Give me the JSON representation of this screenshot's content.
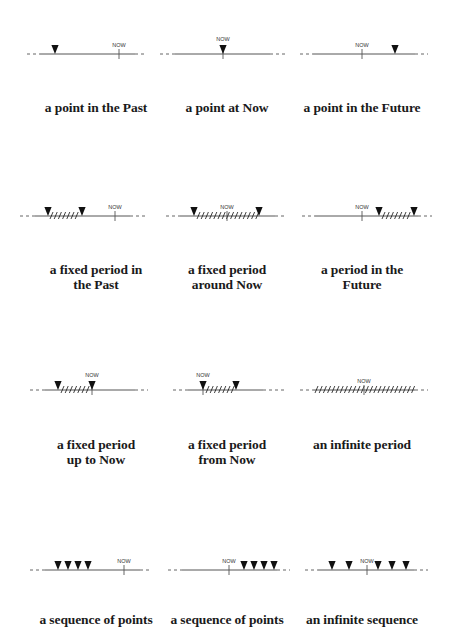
{
  "now_label": "NOW",
  "colors": {
    "line": "#555555",
    "marker": "#111111",
    "text": "#1a1a1a"
  },
  "cells": [
    {
      "id": "point-past",
      "col": 0,
      "row": 0,
      "line_y": 54,
      "solid": [
        40,
        135
      ],
      "dash_left": [
        27,
        40
      ],
      "dash_right": [
        135,
        147
      ],
      "now_x": 119,
      "now_label_above_marker": false,
      "markers": [
        55
      ],
      "hatch": null,
      "label": [
        "a point in the Past"
      ],
      "label_y": 112
    },
    {
      "id": "point-now",
      "col": 1,
      "row": 0,
      "line_y": 54,
      "solid": [
        175,
        270
      ],
      "dash_left": [
        160,
        175
      ],
      "dash_right": [
        270,
        285
      ],
      "now_x": 223,
      "now_label_above_marker": true,
      "markers": [
        223
      ],
      "hatch": null,
      "label": [
        "a point at Now"
      ],
      "label_y": 112
    },
    {
      "id": "point-future",
      "col": 2,
      "row": 0,
      "line_y": 54,
      "solid": [
        313,
        415
      ],
      "dash_left": [
        300,
        313
      ],
      "dash_right": [
        415,
        428
      ],
      "now_x": 362,
      "now_label_above_marker": false,
      "markers": [
        395
      ],
      "hatch": null,
      "label": [
        "a point in the Future"
      ],
      "label_y": 112
    },
    {
      "id": "period-past",
      "col": 0,
      "row": 1,
      "line_y": 216,
      "solid": [
        35,
        130
      ],
      "dash_left": [
        20,
        35
      ],
      "dash_right": [
        130,
        145
      ],
      "now_x": 115,
      "now_label_above_marker": false,
      "markers": [
        48,
        82
      ],
      "hatch": [
        50,
        79
      ],
      "label": [
        "a fixed period in",
        "the Past"
      ],
      "label_y": 274
    },
    {
      "id": "period-around-now",
      "col": 1,
      "row": 1,
      "line_y": 216,
      "solid": [
        180,
        275
      ],
      "dash_left": [
        166,
        180
      ],
      "dash_right": [
        275,
        287
      ],
      "now_x": 227,
      "now_label_above_marker": false,
      "markers": [
        194,
        259
      ],
      "hatch": [
        197,
        256
      ],
      "label": [
        "a fixed period",
        "around Now"
      ],
      "label_y": 274
    },
    {
      "id": "period-future",
      "col": 2,
      "row": 1,
      "line_y": 216,
      "solid": [
        315,
        418
      ],
      "dash_left": [
        302,
        315
      ],
      "dash_right": [
        418,
        432
      ],
      "now_x": 362,
      "now_label_above_marker": false,
      "markers": [
        379,
        414
      ],
      "hatch": [
        382,
        411
      ],
      "label": [
        "a period in the",
        "Future"
      ],
      "label_y": 274
    },
    {
      "id": "period-up-to-now",
      "col": 0,
      "row": 2,
      "line_y": 390,
      "solid": [
        45,
        135
      ],
      "dash_left": [
        30,
        45
      ],
      "dash_right": [
        135,
        148
      ],
      "now_x": 92,
      "now_label_above_marker": true,
      "markers": [
        58,
        92
      ],
      "hatch": [
        61,
        89
      ],
      "label": [
        "a fixed period",
        "up to Now"
      ],
      "label_y": 449
    },
    {
      "id": "period-from-now",
      "col": 1,
      "row": 2,
      "line_y": 390,
      "solid": [
        188,
        263
      ],
      "dash_left": [
        173,
        188
      ],
      "dash_right": [
        263,
        287
      ],
      "now_x": 203,
      "now_label_above_marker": true,
      "markers": [
        203,
        236
      ],
      "hatch": [
        206,
        233
      ],
      "label": [
        "a fixed period",
        "from Now"
      ],
      "label_y": 449
    },
    {
      "id": "infinite-period",
      "col": 2,
      "row": 2,
      "line_y": 390,
      "solid": [
        313,
        415
      ],
      "dash_left": [
        300,
        313
      ],
      "dash_right": [
        415,
        428
      ],
      "now_x": 364,
      "now_label_above_marker": false,
      "markers": [],
      "hatch": [
        315,
        412
      ],
      "label": [
        "an infinite period"
      ],
      "label_y": 449
    },
    {
      "id": "sequence-past",
      "col": 0,
      "row": 3,
      "line_y": 570,
      "solid": [
        45,
        140
      ],
      "dash_left": [
        30,
        45
      ],
      "dash_right": [
        140,
        152
      ],
      "now_x": 124,
      "now_label_above_marker": false,
      "markers": [
        58,
        68,
        78,
        88
      ],
      "hatch": null,
      "label": [
        "a sequence of points"
      ],
      "label_y": 624
    },
    {
      "id": "sequence-future",
      "col": 1,
      "row": 3,
      "line_y": 570,
      "solid": [
        182,
        277
      ],
      "dash_left": [
        168,
        182
      ],
      "dash_right": [
        277,
        290
      ],
      "now_x": 229,
      "now_label_above_marker": false,
      "markers": [
        244,
        254,
        264,
        274
      ],
      "hatch": null,
      "label": [
        "a sequence of points"
      ],
      "label_y": 624
    },
    {
      "id": "infinite-sequence",
      "col": 2,
      "row": 3,
      "line_y": 570,
      "solid": [
        318,
        414
      ],
      "dash_left": [
        305,
        318
      ],
      "dash_right": [
        414,
        428
      ],
      "now_x": 367,
      "now_label_above_marker": false,
      "markers": [
        332,
        349,
        378,
        392,
        406
      ],
      "hatch": null,
      "label": [
        "an infinite sequence"
      ],
      "label_y": 624
    }
  ],
  "col_centers": [
    96,
    227,
    362
  ]
}
